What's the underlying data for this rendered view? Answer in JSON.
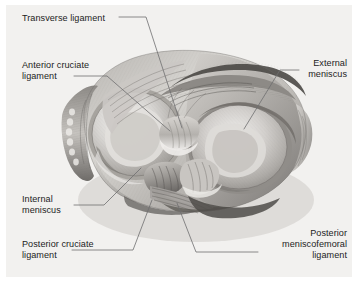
{
  "figure": {
    "background_color": "#f2f1ef",
    "page_color": "#ffffff",
    "text_color": "#1c1c1c",
    "leader_color": "#6e6e70",
    "style": "grayscale anatomical illustration"
  },
  "labels": [
    {
      "id": "transverse-ligament",
      "text": "Transverse ligament",
      "lines": [
        "Transverse ligament"
      ],
      "align": "left",
      "x": 22,
      "y": 13
    },
    {
      "id": "anterior-cruciate-ligament",
      "text": "Anterior cruciate ligament",
      "lines": [
        "Anterior cruciate",
        "ligament"
      ],
      "align": "left",
      "x": 22,
      "y": 60
    },
    {
      "id": "external-meniscus",
      "text": "External meniscus",
      "lines": [
        "External",
        "meniscus"
      ],
      "align": "right",
      "x": 347,
      "y": 58
    },
    {
      "id": "internal-meniscus",
      "text": "Internal meniscus",
      "lines": [
        "Internal",
        "meniscus"
      ],
      "align": "left",
      "x": 22,
      "y": 194
    },
    {
      "id": "posterior-cruciate-ligament",
      "text": "Posterior cruciate ligament",
      "lines": [
        "Posterior cruciate",
        "ligament"
      ],
      "align": "left",
      "x": 22,
      "y": 239
    },
    {
      "id": "posterior-meniscofemoral-ligament",
      "text": "Posterior meniscofemoral ligament",
      "lines": [
        "Posterior",
        "meniscofemoral",
        "ligament"
      ],
      "align": "right",
      "x": 347,
      "y": 228
    }
  ],
  "leaders": [
    {
      "id": "leader-transverse-ligament",
      "points": "119,17 146,17 182,128"
    },
    {
      "id": "leader-anterior-cruciate-ligament",
      "points": "74,76 107,76 170,131"
    },
    {
      "id": "leader-external-meniscus",
      "points": "299,70 280,70 244,129"
    },
    {
      "id": "leader-internal-meniscus",
      "points": "74,205 104,205 141,168"
    },
    {
      "id": "leader-posterior-cruciate-ligament",
      "points": "72,250 133,250 152,200"
    },
    {
      "id": "leader-posterior-meniscofemoral-ligament",
      "points": "258,252 196,252 177,203"
    }
  ]
}
